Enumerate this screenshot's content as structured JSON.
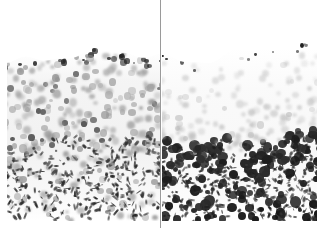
{
  "figure": {
    "type": "micrograph",
    "width": 319,
    "height": 228,
    "background_color": "#ffffff",
    "divider": {
      "name": "panel-divider",
      "orientation": "vertical",
      "x": 160,
      "width": 1,
      "color": "#9a9a9a"
    },
    "colors": {
      "background": "#ffffff",
      "tissue_haze": "#969696",
      "nucleus_pale": "#c8c8c8",
      "nucleus_mid": "#8d8d8d",
      "nucleus_dark": "#3a3a3a",
      "nucleus_intense": "#121212"
    },
    "panels": [
      {
        "id": "left",
        "name": "panel-left",
        "x": 0,
        "width": 161,
        "tissue_top": 55,
        "tissue_bottom": 221,
        "staining": "diffuse moderate nuclear staining distributed evenly throughout full epidermal thickness",
        "nuclei_total": 430,
        "dark_nuclei_fraction": 0.18
      },
      {
        "id": "right",
        "name": "panel-right",
        "x": 162,
        "width": 157,
        "tissue_top": 52,
        "tissue_bottom": 221,
        "staining": "pale upper epidermis with intensely stained nuclei concentrated at the basal layer and dermal-epidermal junction",
        "nuclei_total": 400,
        "dark_nuclei_fraction": 0.3
      }
    ]
  }
}
